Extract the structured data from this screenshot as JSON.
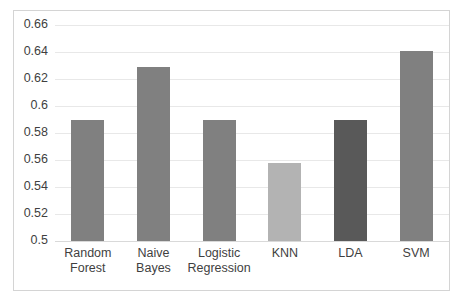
{
  "chart_data": {
    "type": "bar",
    "title": "",
    "xlabel": "",
    "ylabel": "",
    "categories": [
      "Random Forest",
      "Naive Bayes",
      "Logistic Regression",
      "KNN",
      "LDA",
      "SVM"
    ],
    "category_lines": [
      [
        "Random",
        "Forest"
      ],
      [
        "Naive Bayes"
      ],
      [
        "Logistic",
        "Regression"
      ],
      [
        "KNN"
      ],
      [
        "LDA"
      ],
      [
        "SVM"
      ]
    ],
    "values": [
      0.59,
      0.629,
      0.59,
      0.558,
      0.59,
      0.641
    ],
    "bar_colors": [
      "#808080",
      "#808080",
      "#808080",
      "#b3b3b3",
      "#595959",
      "#808080"
    ],
    "ylim": [
      0.5,
      0.66
    ],
    "ytick_values": [
      0.5,
      0.52,
      0.54,
      0.56,
      0.58,
      0.6,
      0.62,
      0.64,
      0.66
    ],
    "ytick_labels": [
      "0.5",
      "0.52",
      "0.54",
      "0.56",
      "0.58",
      "0.6",
      "0.62",
      "0.64",
      "0.66"
    ],
    "grid": true,
    "legend": "none",
    "frame_color": "#d4d4d4",
    "gridline_color": "#e8e8e8",
    "background": "#ffffff"
  }
}
